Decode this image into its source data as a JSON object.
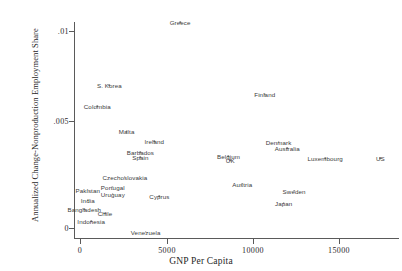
{
  "chart_data": {
    "type": "scatter",
    "title": "",
    "xlabel": "GNP Per Capita",
    "ylabel": "Annualized Change-Nonproduction Employment Share",
    "xlim": [
      -500,
      18500
    ],
    "ylim": [
      -0.0004,
      0.0113
    ],
    "xticks": [
      0,
      5000,
      10000,
      15000
    ],
    "xtick_labels": [
      "0",
      "5000",
      "10000",
      "15000"
    ],
    "yticks": [
      0,
      0.005,
      0.01
    ],
    "ytick_labels": [
      "0",
      ".005",
      ".01"
    ],
    "grid": false,
    "legend": false,
    "points": [
      {
        "label": "Greece",
        "x": 5800,
        "y": 0.01045
      },
      {
        "label": "S. Korea",
        "x": 1700,
        "y": 0.00725
      },
      {
        "label": "Finland",
        "x": 10700,
        "y": 0.0068
      },
      {
        "label": "Colombia",
        "x": 1000,
        "y": 0.00617
      },
      {
        "label": "Malta",
        "x": 2700,
        "y": 0.00492
      },
      {
        "label": "Ireland",
        "x": 4300,
        "y": 0.0044
      },
      {
        "label": "Denmark",
        "x": 11500,
        "y": 0.00435
      },
      {
        "label": "Australia",
        "x": 12000,
        "y": 0.00405
      },
      {
        "label": "Barbados",
        "x": 3500,
        "y": 0.00385
      },
      {
        "label": "Belgium",
        "x": 8600,
        "y": 0.00365
      },
      {
        "label": "Spain",
        "x": 3500,
        "y": 0.0036
      },
      {
        "label": "Luxembourg",
        "x": 14200,
        "y": 0.00355
      },
      {
        "label": "US",
        "x": 17400,
        "y": 0.00355
      },
      {
        "label": "UK",
        "x": 8700,
        "y": 0.00345
      },
      {
        "label": "Czechoslovakia",
        "x": 2600,
        "y": 0.0026
      },
      {
        "label": "Austria",
        "x": 9400,
        "y": 0.00225
      },
      {
        "label": "Portugal",
        "x": 1900,
        "y": 0.0021
      },
      {
        "label": "Sweden",
        "x": 12400,
        "y": 0.0019
      },
      {
        "label": "Pakistan",
        "x": 450,
        "y": 0.00195
      },
      {
        "label": "Uruguay",
        "x": 1900,
        "y": 0.00175
      },
      {
        "label": "Japan",
        "x": 11800,
        "y": 0.00125
      },
      {
        "label": "India",
        "x": 450,
        "y": 0.0014
      },
      {
        "label": "Bangladesh",
        "x": 250,
        "y": 0.00095
      },
      {
        "label": "Chile",
        "x": 1450,
        "y": 0.00075
      },
      {
        "label": "Cyprus",
        "x": 4600,
        "y": 0.0016
      },
      {
        "label": "Indonesia",
        "x": 650,
        "y": 0.00035
      },
      {
        "label": "Venezuela",
        "x": 3800,
        "y": -0.0002
      }
    ]
  },
  "axes": {
    "x_title": "GNP Per Capita",
    "y_title": "Annualized Change-Nonproduction Employment Share",
    "x_tick_labels": [
      "0",
      "5000",
      "10000",
      "15000"
    ],
    "y_tick_labels": [
      "0",
      ".005",
      ".01"
    ]
  },
  "style": {
    "axis_color": "#5a5a5a",
    "label_color": "#3a3a3a",
    "background": "#ffffff"
  }
}
